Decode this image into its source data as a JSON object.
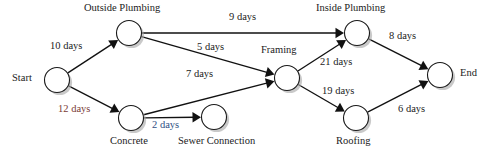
{
  "diagram": {
    "type": "activity-on-arrow-network",
    "nodes": [
      {
        "id": "start",
        "label": "Start",
        "cx": 57,
        "cy": 80,
        "r": 12.5,
        "label_x": 12,
        "label_y": 73,
        "label_align": "left"
      },
      {
        "id": "outside",
        "label": "Outside Plumbing",
        "cx": 129,
        "cy": 33,
        "r": 12.5,
        "label_x": 84,
        "label_y": 3,
        "label_align": "left"
      },
      {
        "id": "concrete",
        "label": "Concrete",
        "cx": 131,
        "cy": 118,
        "r": 12.5,
        "label_x": 110,
        "label_y": 136,
        "label_align": "left"
      },
      {
        "id": "sewer",
        "label": "Sewer Connection",
        "cx": 214,
        "cy": 117,
        "r": 12.5,
        "label_x": 178,
        "label_y": 136,
        "label_align": "left"
      },
      {
        "id": "framing",
        "label": "Framing",
        "cx": 287,
        "cy": 78,
        "r": 12.5,
        "label_x": 261,
        "label_y": 45,
        "label_align": "left"
      },
      {
        "id": "inside",
        "label": "Inside Plumbing",
        "cx": 357,
        "cy": 33,
        "r": 12.5,
        "label_x": 316,
        "label_y": 3,
        "label_align": "left"
      },
      {
        "id": "roofing",
        "label": "Roofing",
        "cx": 356,
        "cy": 118,
        "r": 12.5,
        "label_x": 336,
        "label_y": 136,
        "label_align": "left"
      },
      {
        "id": "end",
        "label": "End",
        "cx": 440,
        "cy": 75,
        "r": 12.5,
        "label_x": 460,
        "label_y": 68,
        "label_align": "left"
      }
    ],
    "edges": [
      {
        "id": "start-outside",
        "from": "start",
        "to": "outside",
        "label": "10 days",
        "label_x": 50,
        "label_y": 41,
        "tint": "none",
        "stroke": "#111111"
      },
      {
        "id": "start-concrete",
        "from": "start",
        "to": "concrete",
        "label": "12 days",
        "label_x": 58,
        "label_y": 104,
        "tint": "red",
        "stroke": "#111111"
      },
      {
        "id": "outside-inside",
        "from": "outside",
        "to": "inside",
        "label": "9 days",
        "label_x": 229,
        "label_y": 12,
        "tint": "none",
        "stroke": "gradient"
      },
      {
        "id": "outside-framing",
        "from": "outside",
        "to": "framing",
        "label": "5 days",
        "label_x": 197,
        "label_y": 42,
        "tint": "none",
        "stroke": "#111111"
      },
      {
        "id": "concrete-sewer",
        "from": "concrete",
        "to": "sewer",
        "label": "2 days",
        "label_x": 152,
        "label_y": 120,
        "tint": "blue",
        "stroke": "#1d3f7a"
      },
      {
        "id": "concrete-framing",
        "from": "concrete",
        "to": "framing",
        "label": "7 days",
        "label_x": 186,
        "label_y": 69,
        "tint": "none",
        "stroke": "#111111"
      },
      {
        "id": "framing-inside",
        "from": "framing",
        "to": "inside",
        "label": "21 days",
        "label_x": 320,
        "label_y": 57,
        "tint": "none",
        "stroke": "#111111"
      },
      {
        "id": "framing-roofing",
        "from": "framing",
        "to": "roofing",
        "label": "19 days",
        "label_x": 322,
        "label_y": 86,
        "tint": "none",
        "stroke": "#111111"
      },
      {
        "id": "inside-end",
        "from": "inside",
        "to": "end",
        "label": "8 days",
        "label_x": 389,
        "label_y": 31,
        "tint": "none",
        "stroke": "#111111"
      },
      {
        "id": "roofing-end",
        "from": "roofing",
        "to": "end",
        "label": "6 days",
        "label_x": 398,
        "label_y": 104,
        "tint": "none",
        "stroke": "#111111"
      }
    ]
  }
}
